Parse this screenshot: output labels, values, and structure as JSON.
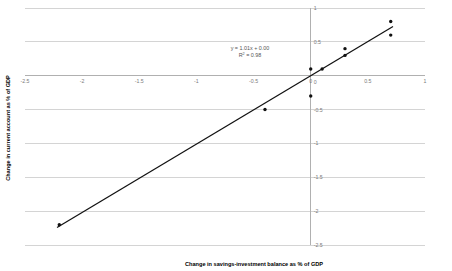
{
  "chart_data": {
    "type": "scatter",
    "title": "",
    "xlabel": "Change in savings-investment balance as % of GDP",
    "ylabel": "Change in current account as % of GDP",
    "xlim": [
      -2.5,
      1
    ],
    "ylim": [
      -2.5,
      1
    ],
    "xticks": [
      -2.5,
      -2,
      -1.5,
      -1,
      -0.5,
      0,
      0.5,
      1
    ],
    "yticks": [
      -2.5,
      -2,
      -1.5,
      -1,
      -0.5,
      0,
      0.5,
      1
    ],
    "xtick_labels": [
      "-2.5",
      "-2",
      "-1.5",
      "-1",
      "-0.5",
      "0",
      "0.5",
      "1"
    ],
    "ytick_labels": [
      "-2.5",
      "-2",
      "-1.5",
      "-1",
      "-0.5",
      "0",
      "0.5",
      "1"
    ],
    "grid": "horizontal",
    "legend": "none",
    "points": [
      {
        "x": -2.2,
        "y": -2.2
      },
      {
        "x": -0.4,
        "y": -0.5
      },
      {
        "x": 0.0,
        "y": -0.3
      },
      {
        "x": 0.0,
        "y": 0.1
      },
      {
        "x": 0.1,
        "y": 0.1
      },
      {
        "x": 0.3,
        "y": 0.3
      },
      {
        "x": 0.3,
        "y": 0.4
      },
      {
        "x": 0.7,
        "y": 0.6
      },
      {
        "x": 0.7,
        "y": 0.8
      }
    ],
    "trendline": {
      "slope": 1.01,
      "intercept": 0.0,
      "x_start": -2.22,
      "x_end": 0.72
    },
    "annotations": {
      "equation": "y = 1.01x + 0.00",
      "r_squared_prefix": "R",
      "r_squared_sup": "2",
      "r_squared_value": " = 0.98"
    },
    "colors": {
      "marker": "#111111",
      "trendline": "#111111",
      "gridline": "#d4d4d4",
      "axis": "#b0b0b0",
      "tick_text": "#7a7a7a",
      "title_text": "#000000",
      "annotation_text": "#555555",
      "background": "#ffffff"
    }
  }
}
